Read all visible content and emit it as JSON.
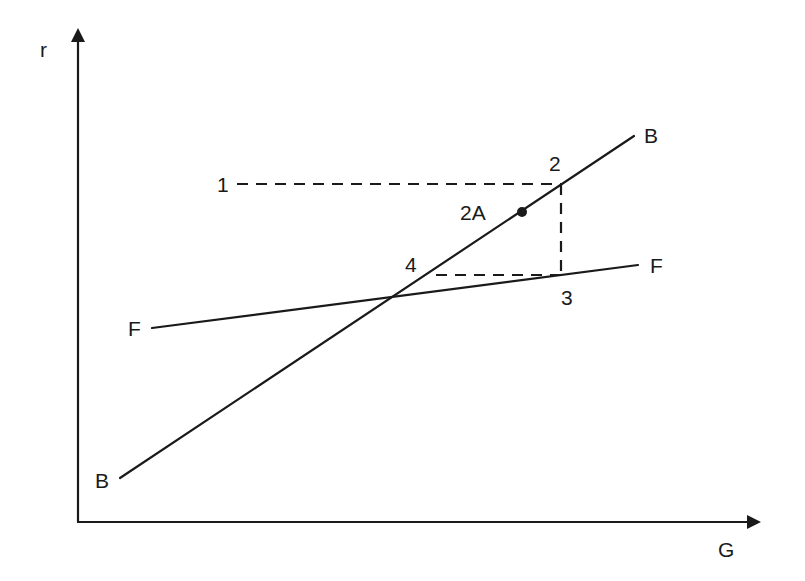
{
  "diagram": {
    "type": "line-diagram",
    "axes": {
      "y_label": "r",
      "x_label": "G"
    },
    "lines": [
      {
        "name": "B",
        "start_label": "B",
        "end_label": "B"
      },
      {
        "name": "F",
        "start_label": "F",
        "end_label": "F"
      }
    ],
    "points": [
      {
        "id": "1",
        "label": "1"
      },
      {
        "id": "2",
        "label": "2"
      },
      {
        "id": "2A",
        "label": "2A"
      },
      {
        "id": "3",
        "label": "3"
      },
      {
        "id": "4",
        "label": "4"
      }
    ],
    "colors": {
      "ink": "#1a1a1a",
      "background": "#ffffff"
    }
  }
}
